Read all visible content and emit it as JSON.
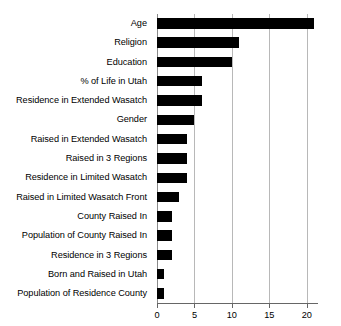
{
  "chart_data": {
    "type": "bar",
    "orientation": "horizontal",
    "title": "",
    "subtitle": "",
    "xlabel": "",
    "ylabel": "",
    "categories": [
      "Age",
      "Religion",
      "Education",
      "% of Life in Utah",
      "Residence in Extended Wasatch",
      "Gender",
      "Raised in Extended Wasatch",
      "Raised in 3 Regions",
      "Residence in Limited Wasatch",
      "Raised in Limited Wasatch Front",
      "County Raised In",
      "Population of County Raised In",
      "Residence in 3 Regions",
      "Born and Raised in Utah",
      "Population of Residence County"
    ],
    "values": [
      21,
      11,
      10,
      6,
      6,
      5,
      4,
      4,
      4,
      3,
      2,
      2,
      2,
      1,
      1
    ],
    "xlim": [
      0,
      21.5
    ],
    "xticks": [
      0,
      5,
      10,
      15,
      20
    ],
    "xticklabels": [
      "0",
      "5",
      "10",
      "15",
      "20"
    ],
    "grid": true,
    "grid_axis": "x",
    "legend": false,
    "bar_color": "#000000",
    "grid_color": "#b8b8b8",
    "axis_color": "#666666",
    "background_color": "#ffffff"
  }
}
